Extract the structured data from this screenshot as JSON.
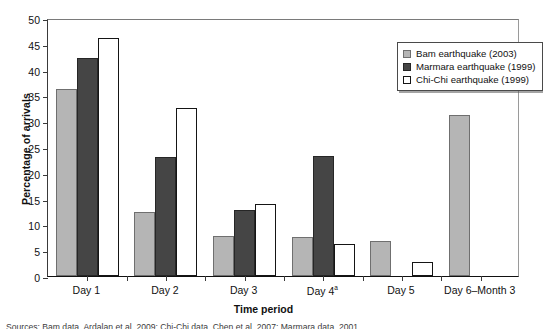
{
  "chart_data": {
    "type": "bar",
    "title": "",
    "xlabel": "Time period",
    "ylabel": "Percentage of arrivals",
    "categories": [
      "Day 1",
      "Day 2",
      "Day 3",
      "Day 4ª",
      "Day 5",
      "Day 6–Month 3"
    ],
    "ylim": [
      0,
      50
    ],
    "yticks": [
      0,
      5,
      10,
      15,
      20,
      25,
      30,
      35,
      40,
      45,
      50
    ],
    "grid": false,
    "legend_position": "top-right",
    "series": [
      {
        "name": "Bam earthquake (2003)",
        "color": "#b5b5b5",
        "values": [
          36.3,
          12.5,
          7.7,
          7.6,
          6.8,
          31.3
        ]
      },
      {
        "name": "Marmara earthquake (1999)",
        "color": "#454545",
        "values": [
          42.3,
          23.0,
          12.7,
          23.3,
          null,
          null
        ]
      },
      {
        "name": "Chi-Chi earthquake (1999)",
        "color": "#ffffff",
        "values": [
          46.1,
          32.5,
          14.0,
          6.2,
          2.7,
          null
        ]
      }
    ]
  },
  "axes": {
    "y_title": "Percentage of arrivals",
    "x_title": "Time period",
    "y_tick_labels": [
      "0",
      "5",
      "10",
      "15",
      "20",
      "25",
      "30",
      "35",
      "40",
      "45",
      "50"
    ],
    "x_tick_labels": [
      "Day 1",
      "Day 2",
      "Day 3",
      "Day 4",
      "Day 5",
      "Day 6–Month 3"
    ],
    "day4_superscript": "a"
  },
  "legend": {
    "items": [
      {
        "label": "Bam earthquake (2003)",
        "swatch": "light-gray-swatch"
      },
      {
        "label": "Marmara earthquake (1999)",
        "swatch": "dark-gray-swatch"
      },
      {
        "label": "Chi-Chi earthquake (1999)",
        "swatch": "white-swatch"
      }
    ]
  },
  "caption": {
    "text": "Sources: Bam data, Ardalan et al. 2009; Chi-Chi data, Chen et al. 2007; Marmara data, 2001"
  },
  "colors": {
    "series_light": "#b5b5b5",
    "series_dark": "#454545",
    "series_open": "#ffffff",
    "axis": "#111111"
  }
}
